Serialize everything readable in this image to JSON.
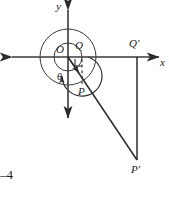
{
  "figure": {
    "stroke_color": "#2b2b2b",
    "background": "#ffffff",
    "width": 169,
    "height": 199
  },
  "axes": {
    "y_label": "y",
    "x_label": "x",
    "origin_label": "O",
    "origin": {
      "x": 68,
      "y": 57
    },
    "x_axis": {
      "x1": 8,
      "x2": 163,
      "y": 57
    },
    "y_axis": {
      "x": 68,
      "y1": 6,
      "y2": 122
    }
  },
  "points": [
    {
      "name": "point-O",
      "label": "O",
      "x": 68,
      "y": 57,
      "label_x": 56,
      "label_y": 45
    },
    {
      "name": "point-Q",
      "label": "Q",
      "x": 82,
      "y": 57,
      "label_x": 75,
      "label_y": 41
    },
    {
      "name": "point-P",
      "label": "P",
      "x": 82,
      "y": 84,
      "label_x": 79,
      "label_y": 88
    },
    {
      "name": "point-Q-prime",
      "label": "Q'",
      "x": 137,
      "y": 57,
      "label_x": 130,
      "label_y": 40
    },
    {
      "name": "point-P-prime",
      "label": "P'",
      "x": 137,
      "y": 160,
      "label_x": 132,
      "label_y": 166
    }
  ],
  "angle": {
    "label": "θ",
    "label_x": 58,
    "label_y": 74
  },
  "circles": [
    {
      "name": "outer-circle",
      "cx": 68,
      "cy": 57,
      "r": 28
    },
    {
      "name": "inner-circle",
      "cx": 68,
      "cy": 57,
      "r": 14
    }
  ],
  "spiral_arc": {
    "name": "theta-sweep-arc",
    "radius": 20
  },
  "right_angle_marker": {
    "name": "right-angle-mark-at-Q",
    "size": 7
  },
  "dashed_segment": {
    "name": "dashed-segment-Q-to-P",
    "from": {
      "x": 82,
      "y": 57
    },
    "to": {
      "x": 82,
      "y": 84
    }
  },
  "rays": [
    {
      "name": "ray-O-to-P-prime",
      "x1": 68,
      "y1": 57,
      "x2": 137,
      "y2": 160
    },
    {
      "name": "segment-Q-prime-to-P-prime",
      "x1": 137,
      "y1": 57,
      "x2": 137,
      "y2": 160
    }
  ],
  "annotation": {
    "page_marker": "–4",
    "marker_x": 0,
    "marker_y": 169
  }
}
